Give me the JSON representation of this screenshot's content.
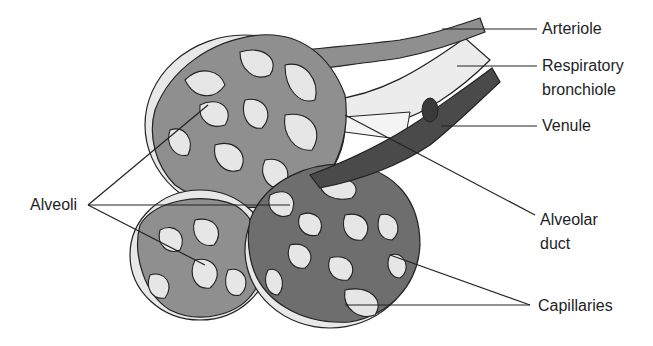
{
  "diagram": {
    "labels": {
      "arteriole": "Arteriole",
      "respiratory_bronchiole_line1": "Respiratory",
      "respiratory_bronchiole_line2": "bronchiole",
      "venule": "Venule",
      "alveoli": "Alveoli",
      "alveolar_duct_line1": "Alveolar",
      "alveolar_duct_line2": "duct",
      "capillaries": "Capillaries"
    },
    "colors": {
      "alveolus_fill": "#e8e8e8",
      "arterial_capillary": "#8f8f8f",
      "venous_capillary": "#6e6e6e",
      "venule": "#4a4a4a",
      "outline": "#222222"
    }
  }
}
